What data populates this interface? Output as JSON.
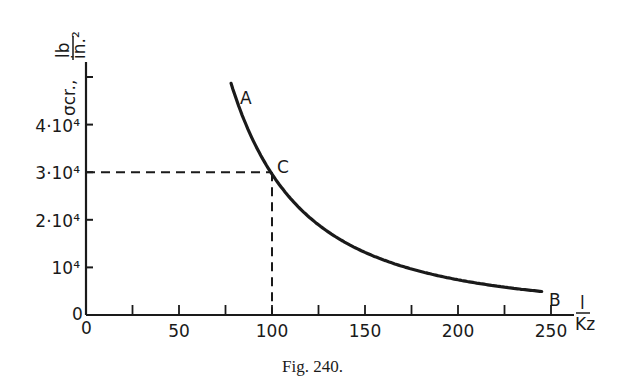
{
  "figure": {
    "caption": "Fig. 240.",
    "y_axis_label": "σcr., lb/in.²",
    "y_axis_symbol": "σcr.,",
    "y_axis_unit_num": "lb",
    "y_axis_unit_den": "in.²",
    "x_axis_label": "l / Kz",
    "x_axis_num": "l",
    "x_axis_den": "Kz",
    "origin_x": "0",
    "origin_y": "0",
    "point_labels": {
      "A": "A",
      "B": "B",
      "C": "C"
    }
  },
  "chart_data": {
    "type": "line",
    "title": "",
    "caption": "Fig. 240.",
    "xlabel": "l/Kz",
    "ylabel": "σcr., lb/in.²",
    "xlim": [
      0,
      260
    ],
    "ylim": [
      0,
      55000
    ],
    "x_ticks": [
      0,
      25,
      50,
      75,
      100,
      125,
      150,
      175,
      200,
      225,
      250
    ],
    "x_tick_labels": [
      "0",
      "",
      "50",
      "",
      "100",
      "",
      "150",
      "",
      "200",
      "",
      "250"
    ],
    "y_ticks": [
      0,
      10000,
      20000,
      30000,
      40000,
      50000
    ],
    "y_tick_labels": [
      "0",
      "10⁴",
      "2·10⁴",
      "3·10⁴",
      "4·10⁴",
      ""
    ],
    "grid": false,
    "legend": null,
    "series": [
      {
        "name": "Euler curve A–B",
        "x": [
          78,
          85,
          90,
          100,
          110,
          125,
          150,
          175,
          200,
          225,
          245
        ],
        "values": [
          48600,
          41000,
          36500,
          29600,
          24500,
          19000,
          13200,
          9700,
          7400,
          5800,
          4900
        ]
      }
    ],
    "annotations": [
      {
        "text": "A",
        "x": 78,
        "y": 48600
      },
      {
        "text": "C",
        "x": 100,
        "y": 30000,
        "note": "dashed guide lines to x=100 and y=3·10⁴"
      },
      {
        "text": "B",
        "x": 245,
        "y": 4900
      }
    ]
  }
}
